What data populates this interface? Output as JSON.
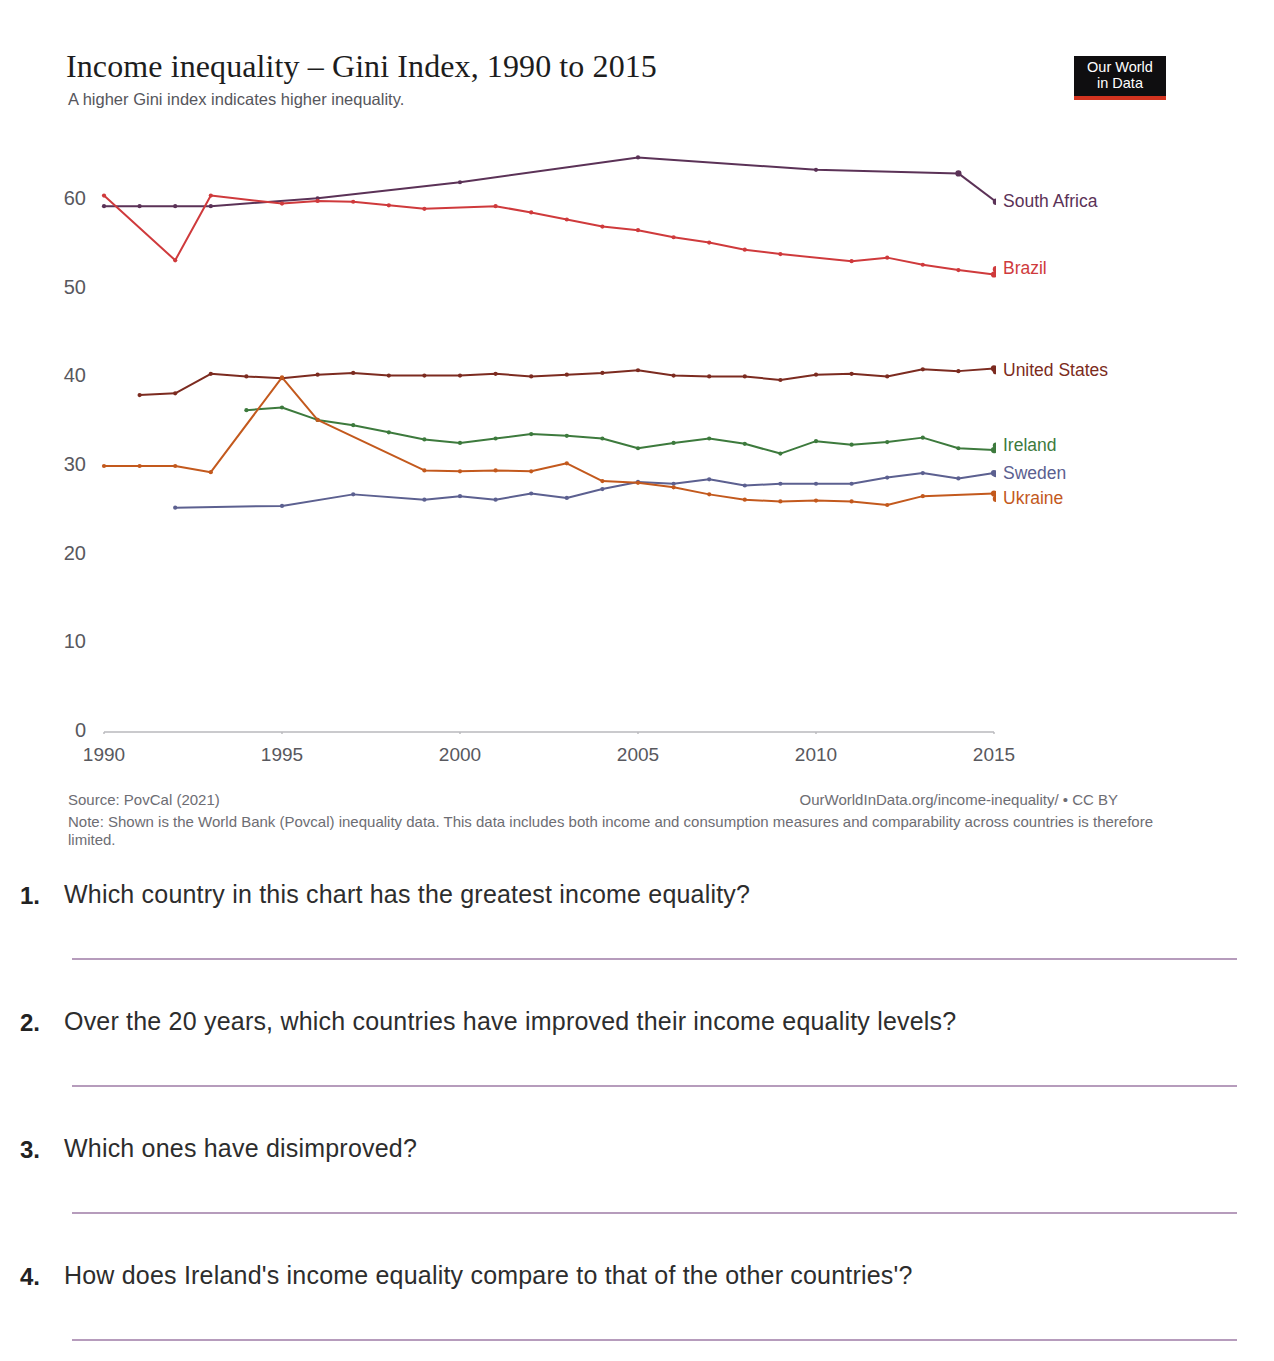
{
  "page": {
    "top_cut_text": "2015. Which and what parties ..."
  },
  "chart": {
    "title": "Income inequality – Gini Index, 1990 to 2015",
    "subtitle": "A higher Gini index indicates higher inequality.",
    "logo": {
      "line1": "Our World",
      "line2": "in Data"
    },
    "source": "Source: PovCal (2021)",
    "attribution": "OurWorldInData.org/income-inequality/ • CC BY",
    "note": "Note: Shown is the World Bank (Povcal) inequality data. This data includes both income and consumption measures and comparability across countries is therefore limited."
  },
  "chart_data": {
    "type": "line",
    "title": "Income inequality – Gini Index, 1990 to 2015",
    "subtitle": "A higher Gini index indicates higher inequality.",
    "xlabel": "",
    "ylabel": "Gini Index",
    "xlim": [
      1990,
      2015
    ],
    "ylim": [
      0,
      65
    ],
    "yticks": [
      0,
      10,
      20,
      30,
      40,
      50,
      60
    ],
    "xticks": [
      1990,
      1995,
      2000,
      2005,
      2010,
      2015
    ],
    "grid": false,
    "legend_position": "right-inline",
    "series": [
      {
        "name": "South Africa",
        "color": "#5b3257",
        "label_color": "#5b3257",
        "points": [
          [
            1990,
            59.3
          ],
          [
            1991,
            59.3
          ],
          [
            1992,
            59.3
          ],
          [
            1993,
            59.3
          ],
          [
            1996,
            60.2
          ],
          [
            2000,
            62.0
          ],
          [
            2005,
            64.8
          ],
          [
            2010,
            63.4
          ],
          [
            2014,
            63.0
          ]
        ]
      },
      {
        "name": "Brazil",
        "color": "#cf3a3c",
        "label_color": "#cf3a3c",
        "points": [
          [
            1990,
            60.5
          ],
          [
            1992,
            53.2
          ],
          [
            1993,
            60.5
          ],
          [
            1995,
            59.6
          ],
          [
            1996,
            59.9
          ],
          [
            1997,
            59.8
          ],
          [
            1998,
            59.4
          ],
          [
            1999,
            59.0
          ],
          [
            2001,
            59.3
          ],
          [
            2002,
            58.6
          ],
          [
            2003,
            57.8
          ],
          [
            2004,
            57.0
          ],
          [
            2005,
            56.6
          ],
          [
            2006,
            55.8
          ],
          [
            2007,
            55.2
          ],
          [
            2008,
            54.4
          ],
          [
            2009,
            53.9
          ],
          [
            2011,
            53.1
          ],
          [
            2012,
            53.5
          ],
          [
            2013,
            52.7
          ],
          [
            2014,
            52.1
          ],
          [
            2015,
            51.6
          ]
        ]
      },
      {
        "name": "United States",
        "color": "#7c2b20",
        "label_color": "#7c2b20",
        "points": [
          [
            1991,
            38.0
          ],
          [
            1992,
            38.2
          ],
          [
            1993,
            40.4
          ],
          [
            1994,
            40.1
          ],
          [
            1995,
            39.9
          ],
          [
            1996,
            40.3
          ],
          [
            1997,
            40.5
          ],
          [
            1998,
            40.2
          ],
          [
            1999,
            40.2
          ],
          [
            2000,
            40.2
          ],
          [
            2001,
            40.4
          ],
          [
            2002,
            40.1
          ],
          [
            2003,
            40.3
          ],
          [
            2004,
            40.5
          ],
          [
            2005,
            40.8
          ],
          [
            2006,
            40.2
          ],
          [
            2007,
            40.1
          ],
          [
            2008,
            40.1
          ],
          [
            2009,
            39.7
          ],
          [
            2010,
            40.3
          ],
          [
            2011,
            40.4
          ],
          [
            2012,
            40.1
          ],
          [
            2013,
            40.9
          ],
          [
            2014,
            40.7
          ],
          [
            2015,
            41.0
          ]
        ]
      },
      {
        "name": "Ireland",
        "color": "#3d7a3d",
        "label_color": "#3d7a3d",
        "points": [
          [
            1994,
            36.3
          ],
          [
            1995,
            36.6
          ],
          [
            1996,
            35.2
          ],
          [
            1997,
            34.6
          ],
          [
            1998,
            33.8
          ],
          [
            1999,
            33.0
          ],
          [
            2000,
            32.6
          ],
          [
            2001,
            33.1
          ],
          [
            2002,
            33.6
          ],
          [
            2003,
            33.4
          ],
          [
            2004,
            33.1
          ],
          [
            2005,
            32.0
          ],
          [
            2006,
            32.6
          ],
          [
            2007,
            33.1
          ],
          [
            2008,
            32.5
          ],
          [
            2009,
            31.4
          ],
          [
            2010,
            32.8
          ],
          [
            2011,
            32.4
          ],
          [
            2012,
            32.7
          ],
          [
            2013,
            33.2
          ],
          [
            2014,
            32.0
          ],
          [
            2015,
            31.8
          ]
        ]
      },
      {
        "name": "Sweden",
        "color": "#5c6090",
        "label_color": "#5c6090",
        "points": [
          [
            1992,
            25.3
          ],
          [
            1995,
            25.5
          ],
          [
            1997,
            26.8
          ],
          [
            1999,
            26.2
          ],
          [
            2000,
            26.6
          ],
          [
            2001,
            26.2
          ],
          [
            2002,
            26.9
          ],
          [
            2003,
            26.4
          ],
          [
            2004,
            27.4
          ],
          [
            2005,
            28.2
          ],
          [
            2006,
            28.0
          ],
          [
            2007,
            28.5
          ],
          [
            2008,
            27.8
          ],
          [
            2009,
            28.0
          ],
          [
            2010,
            28.0
          ],
          [
            2011,
            28.0
          ],
          [
            2012,
            28.7
          ],
          [
            2013,
            29.2
          ],
          [
            2014,
            28.6
          ],
          [
            2015,
            29.2
          ]
        ]
      },
      {
        "name": "Ukraine",
        "color": "#c3591d",
        "label_color": "#c3591d",
        "points": [
          [
            1990,
            30.0
          ],
          [
            1991,
            30.0
          ],
          [
            1992,
            30.0
          ],
          [
            1993,
            29.3
          ],
          [
            1995,
            40.0
          ],
          [
            1996,
            35.2
          ],
          [
            1999,
            29.5
          ],
          [
            2000,
            29.4
          ],
          [
            2001,
            29.5
          ],
          [
            2002,
            29.4
          ],
          [
            2003,
            30.3
          ],
          [
            2004,
            28.3
          ],
          [
            2005,
            28.1
          ],
          [
            2006,
            27.6
          ],
          [
            2007,
            26.8
          ],
          [
            2008,
            26.2
          ],
          [
            2009,
            26.0
          ],
          [
            2010,
            26.1
          ],
          [
            2011,
            26.0
          ],
          [
            2012,
            25.6
          ],
          [
            2013,
            26.6
          ],
          [
            2015,
            26.9
          ]
        ]
      }
    ]
  },
  "questions": [
    {
      "num": "1.",
      "text": "Which country in this chart has the greatest income equality?"
    },
    {
      "num": "2.",
      "text": "Over the 20 years, which countries have improved their income equality levels?"
    },
    {
      "num": "3.",
      "text": "Which ones have disimproved?"
    },
    {
      "num": "4.",
      "text": "How does Ireland's income equality compare to that of the other countries'?"
    }
  ]
}
